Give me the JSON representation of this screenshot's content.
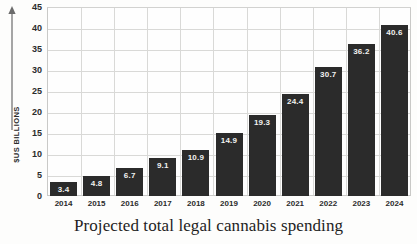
{
  "caption": "Projected total legal cannabis spending",
  "axis_arrow_icon": "up-arrow-icon",
  "chart_data": {
    "type": "bar",
    "title": "Projected total legal cannabis spending",
    "xlabel": "",
    "ylabel": "$US BILLIONS",
    "ylim": [
      0,
      45
    ],
    "yticks": [
      0,
      5,
      10,
      15,
      20,
      25,
      30,
      35,
      40,
      45
    ],
    "grid": true,
    "legend": "none",
    "bar_color": "#2b2b2b",
    "label_color": "#f2f2f0",
    "categories": [
      "2014",
      "2015",
      "2016",
      "2017",
      "2018",
      "2019",
      "2020",
      "2021",
      "2022",
      "2023",
      "2024"
    ],
    "values": [
      3.4,
      4.8,
      6.7,
      9.1,
      10.9,
      14.9,
      19.3,
      24.4,
      30.7,
      36.2,
      40.6
    ],
    "value_labels": [
      "3.4",
      "4.8",
      "6.7",
      "9.1",
      "10.9",
      "14.9",
      "19.3",
      "24.4",
      "30.7",
      "36.2",
      "40.6"
    ]
  }
}
